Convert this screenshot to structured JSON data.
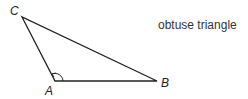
{
  "diagram": {
    "caption": "obtuse triangle",
    "vertices": [
      {
        "label": "C",
        "x": 22,
        "y": 17
      },
      {
        "label": "A",
        "x": 55,
        "y": 81
      },
      {
        "label": "B",
        "x": 157,
        "y": 81
      }
    ],
    "angle_marker_at": "A",
    "line_color": "#222222"
  }
}
